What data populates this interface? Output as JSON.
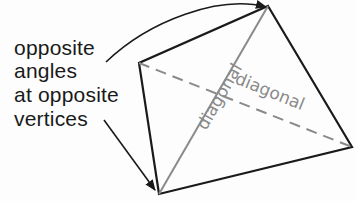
{
  "caption": {
    "lines": [
      "opposite",
      "angles",
      "at opposite",
      "vertices"
    ]
  },
  "diagram": {
    "vertices": {
      "top": [
        268,
        6
      ],
      "left": [
        139,
        63
      ],
      "bottom": [
        159,
        194
      ],
      "right": [
        352,
        147
      ]
    },
    "diagonal_labels": [
      "diagonal",
      "diagonal"
    ],
    "colors": {
      "edge": "#1a1a1a",
      "diagonal": "#8a8a8a",
      "text": "#1a1a1a"
    }
  }
}
